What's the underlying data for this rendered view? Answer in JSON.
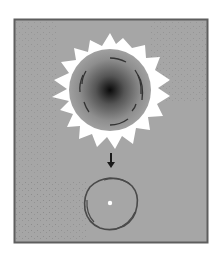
{
  "figure": {
    "title": "",
    "colors": {
      "background": "#a4a4a4",
      "frame_border": "#5e5e5e",
      "corona": "#ffffff",
      "star_core": "#111111",
      "star_edge": "#9a9a9a",
      "ring": "#444444",
      "remnant_core": "#ffffff",
      "arrow": "#1a1a1a"
    },
    "elements": [
      {
        "name": "star-with-corona",
        "label": ""
      },
      {
        "name": "collapse-arrow",
        "label": ""
      },
      {
        "name": "remnant-ring",
        "label": ""
      }
    ]
  }
}
